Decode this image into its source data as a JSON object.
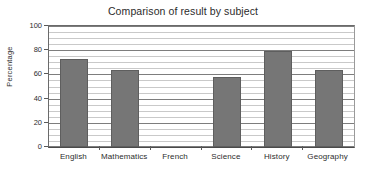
{
  "chart_data": {
    "type": "bar",
    "title": "Comparison of result by subject",
    "xlabel": "",
    "ylabel": "Percentage",
    "categories": [
      "English",
      "Mathematics",
      "French",
      "Science",
      "History",
      "Geography"
    ],
    "values": [
      73,
      64,
      0,
      58,
      79,
      64
    ],
    "ylim": [
      0,
      100
    ],
    "ytick_labels": [
      "0",
      "20",
      "40",
      "60",
      "80",
      "100"
    ],
    "yticks": [
      0,
      20,
      40,
      60,
      80,
      100
    ],
    "minor_gridline_step": 5,
    "major_gridline_step": 20,
    "grid": true,
    "legend": "none",
    "series": [
      {
        "name": "Percentage",
        "values": [
          73,
          64,
          0,
          58,
          79,
          64
        ]
      }
    ],
    "colors": {
      "bar_fill": "#767676",
      "bar_edge": "#5e5e5e",
      "major_gridline": "#7d7d7d",
      "minor_gridline": "#c9c9c9",
      "axis": "#4a4a4a",
      "text": "#2d2d2d",
      "background": "#ffffff"
    }
  }
}
